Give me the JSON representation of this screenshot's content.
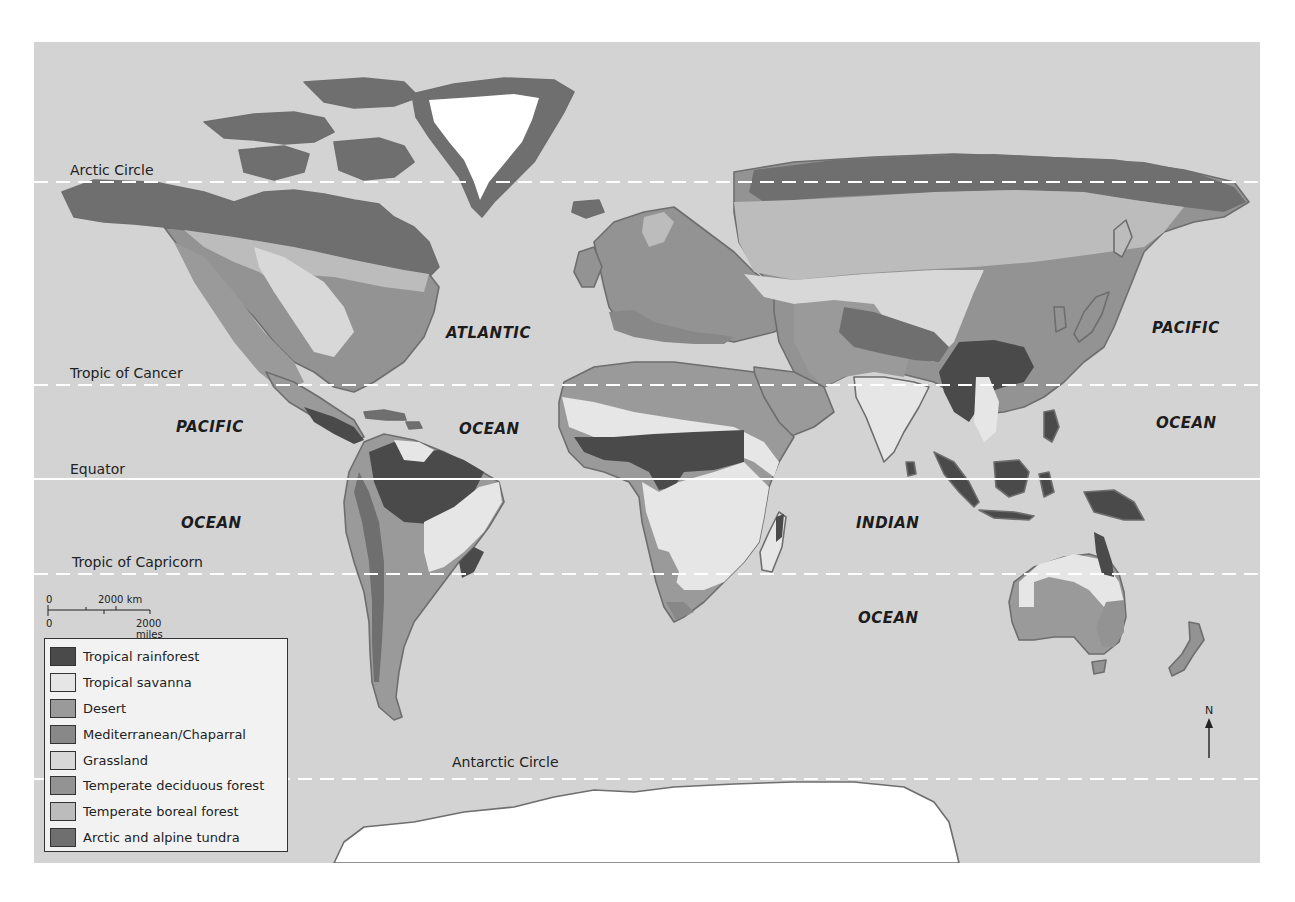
{
  "map": {
    "title": "World biomes map",
    "colors": {
      "ocean": "#d3d3d3",
      "ice": "#ffffff",
      "coast": "#6e6e6e",
      "lat_line": "#ffffff"
    },
    "latitude_lines": [
      {
        "label": "Arctic Circle",
        "style": "dashed"
      },
      {
        "label": "Tropic of Cancer",
        "style": "dashed"
      },
      {
        "label": "Equator",
        "style": "solid"
      },
      {
        "label": "Tropic of Capricorn",
        "style": "dashed"
      },
      {
        "label": "Antarctic Circle",
        "style": "dashed"
      }
    ],
    "ocean_labels": {
      "atlantic_1": "ATLANTIC",
      "atlantic_2": "OCEAN",
      "pacific_west_1": "PACIFIC",
      "pacific_west_2": "OCEAN",
      "pacific_east_1": "PACIFIC",
      "pacific_east_2": "OCEAN",
      "indian_1": "INDIAN",
      "indian_2": "OCEAN"
    },
    "scale_bar": {
      "km_zero": "0",
      "km_label": "2000 km",
      "mi_zero": "0",
      "mi_label": "2000 miles"
    },
    "north_arrow": {
      "label": "N"
    },
    "legend": {
      "items": [
        {
          "label": "Tropical rainforest",
          "color": "#4a4a4a"
        },
        {
          "label": "Tropical savanna",
          "color": "#e6e6e6"
        },
        {
          "label": "Desert",
          "color": "#9a9a9a"
        },
        {
          "label": "Mediterranean/Chaparral",
          "color": "#888888"
        },
        {
          "label": "Grassland",
          "color": "#d8d8d8"
        },
        {
          "label": "Temperate deciduous forest",
          "color": "#939393"
        },
        {
          "label": "Temperate boreal forest",
          "color": "#bcbcbc"
        },
        {
          "label": "Arctic and alpine tundra",
          "color": "#6f6f6f"
        }
      ]
    }
  }
}
